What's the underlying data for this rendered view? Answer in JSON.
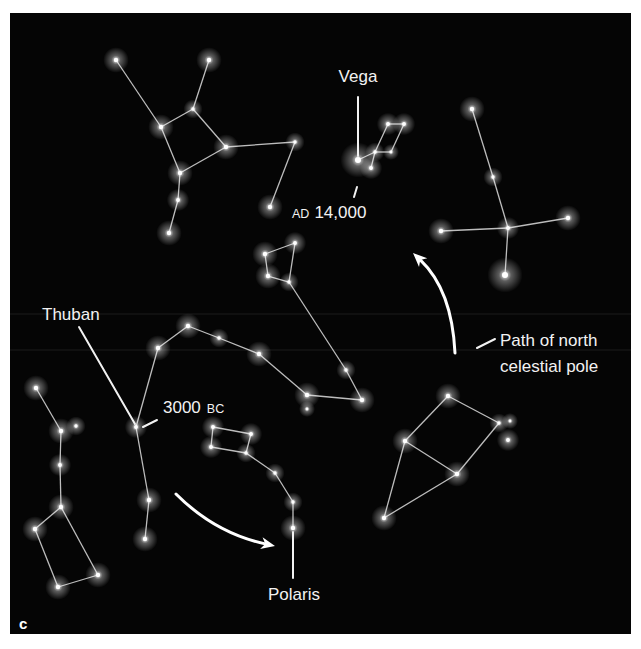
{
  "figure": {
    "panel_letter": "c",
    "background": "#050505",
    "star_color": "#ffffff",
    "line_color": "#bdbdbd",
    "label_color": "#f2f2f2"
  },
  "labels": {
    "vega": "Vega",
    "ad_prefix": "AD",
    "ad_year": "14,000",
    "thuban": "Thuban",
    "bc_year": "3000",
    "bc_suffix": "BC",
    "polaris": "Polaris",
    "path_line1": "Path of north",
    "path_line2": "celestial pole"
  },
  "constellations": [
    {
      "name": "hercules",
      "stars": [
        [
          116,
          60,
          4
        ],
        [
          209,
          60,
          4
        ],
        [
          193,
          109,
          3
        ],
        [
          161,
          127,
          4
        ],
        [
          226,
          147,
          4
        ],
        [
          295,
          142,
          3
        ],
        [
          180,
          173,
          4
        ],
        [
          178,
          200,
          3.5
        ],
        [
          169,
          233,
          4
        ],
        [
          270,
          207,
          4
        ]
      ],
      "edges": [
        [
          0,
          3
        ],
        [
          1,
          2
        ],
        [
          2,
          3
        ],
        [
          2,
          4
        ],
        [
          3,
          6
        ],
        [
          6,
          4
        ],
        [
          4,
          5
        ],
        [
          5,
          9
        ],
        [
          6,
          7
        ],
        [
          7,
          8
        ]
      ]
    },
    {
      "name": "lyra",
      "stars": [
        [
          358,
          160,
          5.5
        ],
        [
          388,
          124,
          3.5
        ],
        [
          404,
          124,
          3.5
        ],
        [
          375,
          152,
          3
        ],
        [
          391,
          152,
          2.5
        ],
        [
          371,
          168,
          3.5
        ]
      ],
      "edges": [
        [
          0,
          3
        ],
        [
          3,
          4
        ],
        [
          3,
          1
        ],
        [
          1,
          2
        ],
        [
          2,
          4
        ],
        [
          3,
          5
        ]
      ]
    },
    {
      "name": "cygnus",
      "stars": [
        [
          472,
          109,
          4
        ],
        [
          493,
          177,
          3
        ],
        [
          508,
          228,
          3.5
        ],
        [
          441,
          231,
          4
        ],
        [
          568,
          218,
          4
        ],
        [
          505,
          275,
          5.5
        ]
      ],
      "edges": [
        [
          0,
          1
        ],
        [
          1,
          2
        ],
        [
          2,
          3
        ],
        [
          2,
          4
        ],
        [
          2,
          5
        ]
      ]
    },
    {
      "name": "draco",
      "stars": [
        [
          265,
          254,
          4
        ],
        [
          295,
          243,
          3.5
        ],
        [
          268,
          276,
          4
        ],
        [
          289,
          282,
          3
        ],
        [
          346,
          370,
          3
        ],
        [
          362,
          400,
          4
        ],
        [
          307,
          395,
          4
        ],
        [
          259,
          354,
          4
        ],
        [
          219,
          338,
          3
        ],
        [
          188,
          326,
          4
        ],
        [
          158,
          348,
          4
        ],
        [
          136,
          427,
          3.5
        ],
        [
          149,
          500,
          4
        ],
        [
          145,
          539,
          4
        ],
        [
          307,
          409,
          2.5
        ]
      ],
      "edges": [
        [
          0,
          1
        ],
        [
          0,
          2
        ],
        [
          2,
          3
        ],
        [
          1,
          3
        ],
        [
          3,
          4
        ],
        [
          4,
          5
        ],
        [
          5,
          6
        ],
        [
          6,
          7
        ],
        [
          7,
          8
        ],
        [
          8,
          9
        ],
        [
          9,
          10
        ],
        [
          10,
          11
        ],
        [
          11,
          12
        ],
        [
          12,
          13
        ]
      ]
    },
    {
      "name": "cepheus",
      "stars": [
        [
          448,
          396,
          4
        ],
        [
          499,
          423,
          3
        ],
        [
          405,
          441,
          4
        ],
        [
          457,
          474,
          4
        ],
        [
          384,
          518,
          4
        ],
        [
          510,
          421,
          2.5
        ],
        [
          508,
          440,
          3.5
        ]
      ],
      "edges": [
        [
          0,
          1
        ],
        [
          0,
          2
        ],
        [
          2,
          3
        ],
        [
          3,
          1
        ],
        [
          2,
          4
        ],
        [
          4,
          3
        ]
      ]
    },
    {
      "name": "ursa-minor",
      "stars": [
        [
          213,
          427,
          3.5
        ],
        [
          251,
          434,
          3.5
        ],
        [
          211,
          447,
          3.5
        ],
        [
          246,
          453,
          3
        ],
        [
          275,
          473,
          3
        ],
        [
          293,
          502,
          3
        ],
        [
          293,
          528,
          4
        ]
      ],
      "edges": [
        [
          0,
          1
        ],
        [
          0,
          2
        ],
        [
          2,
          3
        ],
        [
          1,
          3
        ],
        [
          3,
          4
        ],
        [
          4,
          5
        ],
        [
          5,
          6
        ]
      ]
    },
    {
      "name": "ursa-major",
      "stars": [
        [
          36,
          388,
          4
        ],
        [
          61,
          431,
          4
        ],
        [
          76,
          426,
          3
        ],
        [
          60,
          465,
          3.5
        ],
        [
          61,
          507,
          4
        ],
        [
          35,
          529,
          4
        ],
        [
          98,
          575,
          4
        ],
        [
          58,
          587,
          4
        ]
      ],
      "edges": [
        [
          0,
          1
        ],
        [
          1,
          3
        ],
        [
          3,
          4
        ],
        [
          4,
          5
        ],
        [
          4,
          6
        ],
        [
          5,
          7
        ],
        [
          7,
          6
        ]
      ]
    }
  ],
  "paths": {
    "upper_arrow": {
      "from": [
        455,
        353
      ],
      "ctrl": [
        452,
        290
      ],
      "to": [
        413,
        253
      ]
    },
    "lower_arrow": {
      "from": [
        176,
        494
      ],
      "ctrl": [
        215,
        533
      ],
      "to": [
        275,
        546
      ]
    }
  }
}
